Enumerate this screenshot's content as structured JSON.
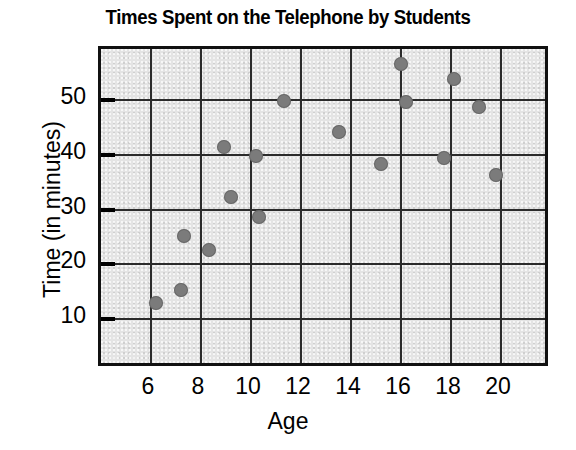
{
  "chart_data": {
    "type": "scatter",
    "title": "Times Spent on the Telephone by Students",
    "xlabel": "Age",
    "ylabel": "Time (in minutes)",
    "xlim": [
      5,
      21
    ],
    "ylim": [
      0,
      58
    ],
    "xticks": [
      6,
      8,
      10,
      12,
      14,
      16,
      18,
      20
    ],
    "yticks": [
      10,
      20,
      30,
      40,
      50
    ],
    "grid": true,
    "legend": null,
    "series": [
      {
        "name": "Students",
        "marker": "circle",
        "color": "#7b7b7b",
        "points": [
          {
            "x": 6.2,
            "y": 13.0
          },
          {
            "x": 7.2,
            "y": 15.3
          },
          {
            "x": 7.3,
            "y": 25.1
          },
          {
            "x": 8.3,
            "y": 22.6
          },
          {
            "x": 8.9,
            "y": 41.5
          },
          {
            "x": 9.2,
            "y": 32.2
          },
          {
            "x": 10.2,
            "y": 39.8
          },
          {
            "x": 10.3,
            "y": 28.6
          },
          {
            "x": 11.3,
            "y": 49.8
          },
          {
            "x": 13.5,
            "y": 44.2
          },
          {
            "x": 15.2,
            "y": 38.4
          },
          {
            "x": 16.0,
            "y": 56.5
          },
          {
            "x": 16.2,
            "y": 49.7
          },
          {
            "x": 17.7,
            "y": 39.4
          },
          {
            "x": 18.1,
            "y": 53.8
          },
          {
            "x": 19.1,
            "y": 48.7
          },
          {
            "x": 19.8,
            "y": 36.3
          }
        ]
      }
    ]
  },
  "axis": {
    "x_tick_labels": [
      "6",
      "8",
      "10",
      "12",
      "14",
      "16",
      "18",
      "20"
    ],
    "y_tick_labels": [
      "10",
      "20",
      "30",
      "40",
      "50"
    ]
  },
  "colors": {
    "marker": "#7b7b7b",
    "plot_background": "#e4e4e4",
    "frame": "#111111",
    "gridline": "#2b2b2b",
    "text": "#000000"
  }
}
